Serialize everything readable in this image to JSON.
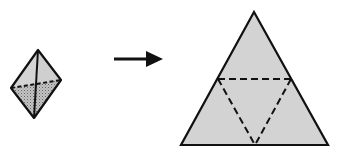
{
  "figure": {
    "colors": {
      "face_fill": "#d0d0d0",
      "face_fill_light": "#d6d6d6",
      "shaded_fill": "#b8b8b8",
      "stroke": "#111111",
      "background": "#ffffff"
    },
    "solid": {
      "label": "3D tetrahedron view",
      "apex": [
        38,
        50
      ],
      "left": [
        11,
        88
      ],
      "right": [
        61,
        80
      ],
      "bottom": [
        34,
        118
      ]
    },
    "arrow": {
      "label": "transforms into",
      "x1": 114,
      "y1": 59,
      "x2": 162,
      "y2": 59
    },
    "net": {
      "label": "Triangular net with folds",
      "apex": [
        254,
        12
      ],
      "base_left": [
        181,
        145
      ],
      "base_right": [
        328,
        145
      ],
      "mid_left": [
        218,
        79
      ],
      "mid_right": [
        291,
        79
      ],
      "mid_bottom": [
        255,
        145
      ]
    }
  }
}
